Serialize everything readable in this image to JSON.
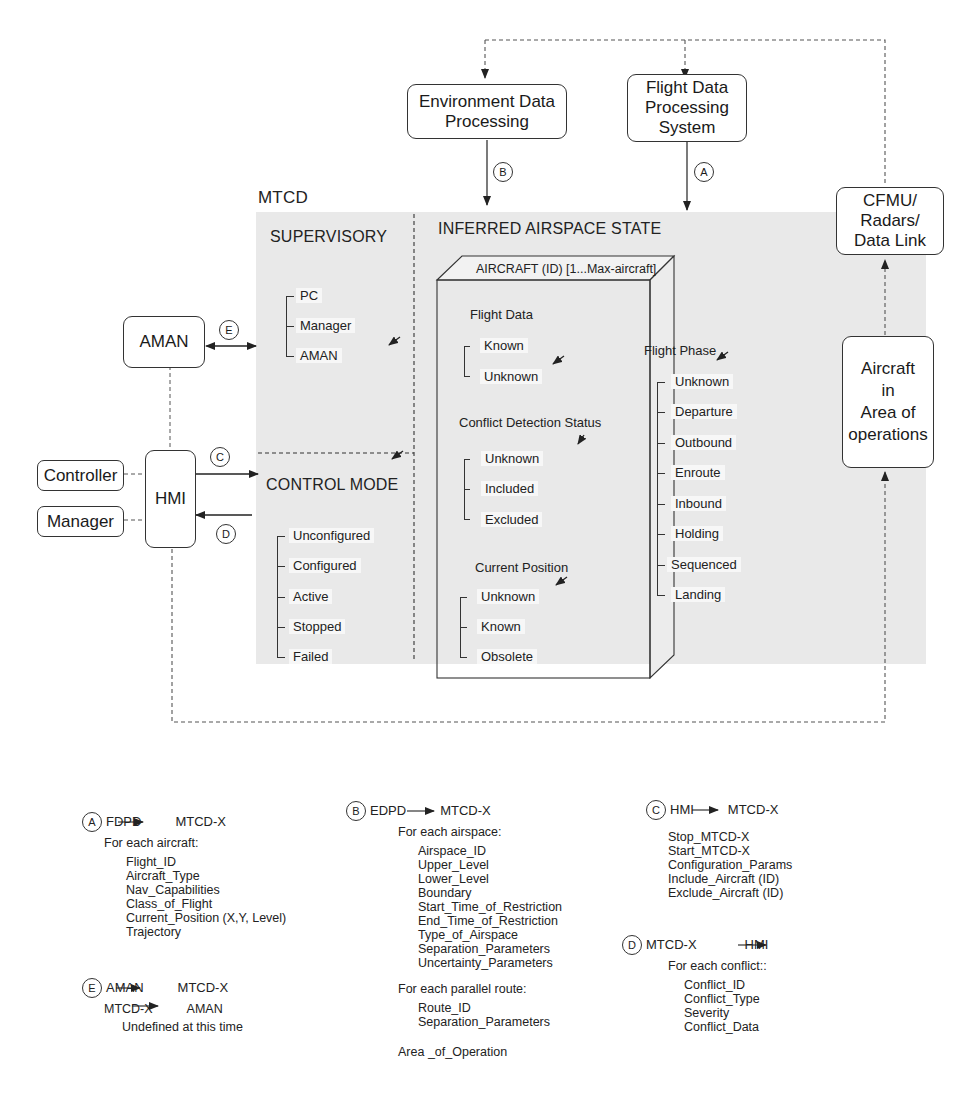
{
  "top_cutoff_text": "",
  "external": {
    "environment_data_processing": "Environment Data\nProcessing",
    "flight_data_processing_system": "Flight Data\nProcessing\nSystem",
    "cfmu": "CFMU/\nRadars/\nData Link",
    "aircraft_area": "Aircraft\nin\nArea of\noperations",
    "aman": "AMAN",
    "hmi": "HMI",
    "controller": "Controller",
    "manager": "Manager"
  },
  "labels": {
    "mtcd": "MTCD",
    "supervisory": "SUPERVISORY",
    "inferred_airspace_state": "INFERRED AIRSPACE STATE",
    "control_mode": "CONTROL MODE",
    "aircraft_box": "AIRCRAFT (ID) [1...Max-aircraft]"
  },
  "connectors": {
    "A": "A",
    "B": "B",
    "C": "C",
    "D": "D",
    "E": "E"
  },
  "supervisory": {
    "states": [
      "PC",
      "Manager",
      "AMAN"
    ]
  },
  "control_mode": {
    "states": [
      "Unconfigured",
      "Configured",
      "Active",
      "Stopped",
      "Failed"
    ]
  },
  "aircraft": {
    "flight_data": {
      "title": "Flight Data",
      "states": [
        "Known",
        "Unknown"
      ]
    },
    "conflict_detection_status": {
      "title": "Conflict Detection Status",
      "states": [
        "Unknown",
        "Included",
        "Excluded"
      ]
    },
    "current_position": {
      "title": "Current Position",
      "states": [
        "Unknown",
        "Known",
        "Obsolete"
      ]
    },
    "flight_phase": {
      "title": "Flight Phase",
      "states": [
        "Unknown",
        "Departure",
        "Outbound",
        "Enroute",
        "Inbound",
        "Holding",
        "Sequenced",
        "Landing"
      ]
    }
  },
  "legend": {
    "A": {
      "circle": "A",
      "from": "FDPD",
      "to": "MTCD-X",
      "sub": "For each aircraft:",
      "items": [
        "Flight_ID",
        "Aircraft_Type",
        "Nav_Capabilities",
        "Class_of_Flight",
        "Current_Position (X,Y, Level)",
        "Trajectory"
      ]
    },
    "E": {
      "circle": "E",
      "line1_from": "AMAN",
      "line1_to": "MTCD-X",
      "line2_from": "MTCD-X",
      "line2_to": "AMAN",
      "note": "Undefined at this time"
    },
    "B": {
      "circle": "B",
      "from": "EDPD",
      "to": "MTCD-X",
      "sub1": "For each airspace:",
      "items1": [
        "Airspace_ID",
        "Upper_Level",
        "Lower_Level",
        "Boundary",
        "Start_Time_of_Restriction",
        "End_Time_of_Restriction",
        "Type_of_Airspace",
        "Separation_Parameters",
        "Uncertainty_Parameters"
      ],
      "sub2": "For each parallel route:",
      "items2": [
        "Route_ID",
        "Separation_Parameters"
      ],
      "footer": "Area _of_Operation"
    },
    "C": {
      "circle": "C",
      "from": "HMI",
      "to": "MTCD-X",
      "items": [
        "Stop_MTCD-X",
        "Start_MTCD-X",
        "Configuration_Params",
        "Include_Aircraft (ID)",
        "Exclude_Aircraft (ID)"
      ]
    },
    "D": {
      "circle": "D",
      "from": "MTCD-X",
      "to": "HMI",
      "sub": "For each conflict::",
      "items": [
        "Conflict_ID",
        "Conflict_Type",
        "Severity",
        "Conflict_Data"
      ]
    }
  }
}
